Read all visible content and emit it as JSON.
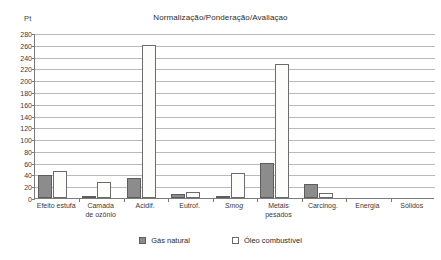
{
  "chart_data": {
    "type": "bar",
    "title": "Normalização/Ponderação/Avaliaçao",
    "xlabel": "",
    "ylabel": "Pt",
    "ylim": [
      0,
      280
    ],
    "yticks": [
      0,
      20,
      40,
      60,
      80,
      100,
      120,
      140,
      160,
      180,
      200,
      220,
      240,
      260,
      280
    ],
    "grid": true,
    "legend_position": "bottom",
    "categories": [
      "Efeito estufa",
      "Camada de ozônio",
      "Acidif.",
      "Eutrof.",
      "Smog",
      "Metais pesados",
      "Carcinog.",
      "Energia",
      "Sólidos"
    ],
    "category_lines": [
      [
        "Efeito estufa"
      ],
      [
        "Camada",
        "de ozônio"
      ],
      [
        "Acidif."
      ],
      [
        "Eutrof."
      ],
      [
        "Smog"
      ],
      [
        "Metais",
        "pesados"
      ],
      [
        "Carcinog."
      ],
      [
        "Energia"
      ],
      [
        "Sólidos"
      ]
    ],
    "italic_categories": [
      "Smog"
    ],
    "series": [
      {
        "name": "Gás natural",
        "color": "#8c8c8c",
        "values": [
          39,
          2,
          34,
          6,
          3,
          60,
          23,
          0,
          0
        ]
      },
      {
        "name": "Óleo combustível",
        "color": "#ffffff",
        "values": [
          46,
          28,
          260,
          10,
          42,
          228,
          9,
          0,
          0
        ]
      }
    ]
  },
  "axis": {
    "unit_label": "Pt"
  },
  "legend": {
    "items": [
      {
        "label": "Gás natural",
        "swatch": "gas"
      },
      {
        "label": "Óleo combustível",
        "swatch": "oleo"
      }
    ]
  }
}
